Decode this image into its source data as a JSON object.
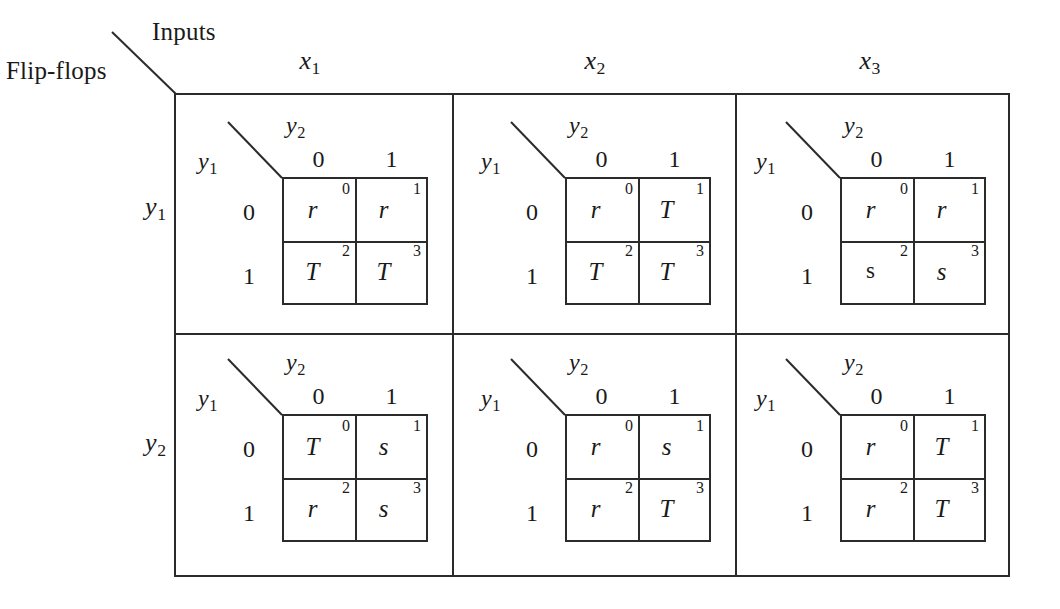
{
  "figure": {
    "corner": {
      "inputs_label": "Inputs",
      "flipflops_label": "Flip-flops"
    },
    "column_headers": [
      {
        "base": "x",
        "sub": "1"
      },
      {
        "base": "x",
        "sub": "2"
      },
      {
        "base": "x",
        "sub": "3"
      }
    ],
    "row_headers": [
      {
        "base": "y",
        "sub": "1"
      },
      {
        "base": "y",
        "sub": "2"
      }
    ],
    "kmap_legend": {
      "diag_top_base": "y",
      "diag_top_sub": "2",
      "diag_left_base": "y",
      "diag_left_sub": "1",
      "col_labels": [
        "0",
        "1"
      ],
      "row_labels": [
        "0",
        "1"
      ],
      "cell_indices": [
        "0",
        "1",
        "2",
        "3"
      ]
    },
    "maps": [
      {
        "id": "map-y1-x1",
        "row": "y1",
        "column": "x1",
        "cells": [
          {
            "index": "0",
            "value": "r",
            "style": "italic"
          },
          {
            "index": "1",
            "value": "r",
            "style": "italic"
          },
          {
            "index": "2",
            "value": "T",
            "style": "italic"
          },
          {
            "index": "3",
            "value": "T",
            "style": "italic"
          }
        ]
      },
      {
        "id": "map-y1-x2",
        "row": "y1",
        "column": "x2",
        "cells": [
          {
            "index": "0",
            "value": "r",
            "style": "italic"
          },
          {
            "index": "1",
            "value": "T",
            "style": "italic"
          },
          {
            "index": "2",
            "value": "T",
            "style": "italic"
          },
          {
            "index": "3",
            "value": "T",
            "style": "italic"
          }
        ]
      },
      {
        "id": "map-y1-x3",
        "row": "y1",
        "column": "x3",
        "cells": [
          {
            "index": "0",
            "value": "r",
            "style": "italic"
          },
          {
            "index": "1",
            "value": "r",
            "style": "italic"
          },
          {
            "index": "2",
            "value": "s",
            "style": "roman"
          },
          {
            "index": "3",
            "value": "s",
            "style": "italic"
          }
        ]
      },
      {
        "id": "map-y2-x1",
        "row": "y2",
        "column": "x1",
        "cells": [
          {
            "index": "0",
            "value": "T",
            "style": "italic"
          },
          {
            "index": "1",
            "value": "s",
            "style": "italic"
          },
          {
            "index": "2",
            "value": "r",
            "style": "italic"
          },
          {
            "index": "3",
            "value": "s",
            "style": "italic"
          }
        ]
      },
      {
        "id": "map-y2-x2",
        "row": "y2",
        "column": "x2",
        "cells": [
          {
            "index": "0",
            "value": "r",
            "style": "italic"
          },
          {
            "index": "1",
            "value": "s",
            "style": "italic"
          },
          {
            "index": "2",
            "value": "r",
            "style": "italic"
          },
          {
            "index": "3",
            "value": "T",
            "style": "italic"
          }
        ]
      },
      {
        "id": "map-y2-x3",
        "row": "y2",
        "column": "x3",
        "cells": [
          {
            "index": "0",
            "value": "r",
            "style": "italic"
          },
          {
            "index": "1",
            "value": "T",
            "style": "italic"
          },
          {
            "index": "2",
            "value": "r",
            "style": "italic"
          },
          {
            "index": "3",
            "value": "T",
            "style": "italic"
          }
        ]
      }
    ],
    "colors": {
      "line": "#2b2b2b",
      "text": "#1a1a1a",
      "background": "#ffffff"
    }
  }
}
